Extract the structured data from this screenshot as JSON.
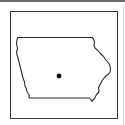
{
  "map": {
    "region": "Iowa",
    "marker_label": "Location marker",
    "colors": {
      "outline": "#2a2a2a",
      "frame": "#3a3a3a",
      "marker": "#111111",
      "background": "#ffffff"
    },
    "marker": {
      "cx": 59,
      "cy": 76,
      "r": 2.4
    }
  }
}
